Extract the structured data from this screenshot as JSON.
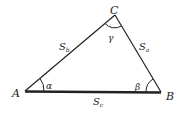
{
  "diagram": {
    "vertices": [
      {
        "label": "A"
      },
      {
        "label": "B"
      },
      {
        "label": "C"
      }
    ],
    "sides": [
      {
        "label": "S",
        "sub": "b"
      },
      {
        "label": "S",
        "sub": "a"
      },
      {
        "label": "S",
        "sub": "c"
      }
    ],
    "angles": [
      {
        "label": "α"
      },
      {
        "label": "β"
      },
      {
        "label": "γ"
      }
    ],
    "colors": {
      "stroke": "#222222",
      "background": "#ffffff"
    }
  }
}
